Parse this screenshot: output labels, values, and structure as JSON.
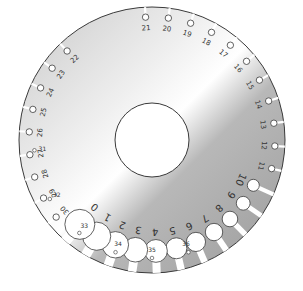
{
  "image": {
    "subject": "wire gauge disc",
    "colors": {
      "metal_light": "#f4f4f4",
      "metal_dark": "#a8a8a8",
      "outline": "#3a3a3a",
      "background": "#ffffff"
    }
  },
  "outer_slots": [
    {
      "label": "21"
    },
    {
      "label": "20"
    },
    {
      "label": "19"
    },
    {
      "label": "18"
    },
    {
      "label": "17"
    },
    {
      "label": "16"
    },
    {
      "label": "15"
    },
    {
      "label": "14"
    },
    {
      "label": "13"
    },
    {
      "label": "12"
    },
    {
      "label": "11"
    },
    {
      "label": "10"
    },
    {
      "label": "9"
    },
    {
      "label": "8"
    },
    {
      "label": "7"
    },
    {
      "label": "6"
    },
    {
      "label": "5"
    },
    {
      "label": "4"
    },
    {
      "label": "3"
    },
    {
      "label": "2"
    },
    {
      "label": "1"
    },
    {
      "label": "0"
    },
    {
      "label": "30"
    },
    {
      "label": "29"
    },
    {
      "label": "28"
    },
    {
      "label": "27"
    },
    {
      "label": "26"
    },
    {
      "label": "25"
    },
    {
      "label": "24"
    },
    {
      "label": "23"
    },
    {
      "label": "22"
    }
  ],
  "small_holes": [
    {
      "label": "31"
    },
    {
      "label": "32"
    },
    {
      "label": "33"
    },
    {
      "label": "34"
    },
    {
      "label": "35"
    },
    {
      "label": "36"
    }
  ]
}
